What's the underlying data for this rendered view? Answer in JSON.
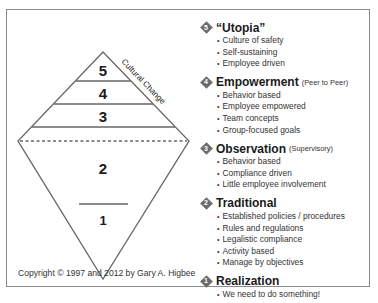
{
  "diagram": {
    "pyramid_labels": [
      "5",
      "4",
      "3",
      "2",
      "1"
    ],
    "axis_label": "Cultural Change",
    "copyright": "Copyright © 1997 and 2012 by Gary A. Higbee",
    "colors": {
      "line": "#666666",
      "badge": "#6b6b6b",
      "frame": "#8a8a8a"
    }
  },
  "levels": [
    {
      "number": "5",
      "title": "“Utopia”",
      "subtitle": "",
      "bullets": [
        "Culture of safety",
        "Self-sustaining",
        "Employee driven"
      ]
    },
    {
      "number": "4",
      "title": "Empowerment",
      "subtitle": "(Peer to Peer)",
      "bullets": [
        "Behavior based",
        "Employee empowered",
        "Team concepts",
        "Group-focused goals"
      ]
    },
    {
      "number": "3",
      "title": "Observation",
      "subtitle": "(Supervisory)",
      "bullets": [
        "Behavior based",
        "Compliance driven",
        "Little employee involvement"
      ]
    },
    {
      "number": "2",
      "title": "Traditional",
      "subtitle": "",
      "bullets": [
        "Established policies / procedures",
        "Rules and regulations",
        "Legalistic compliance",
        "Activity based",
        "Manage by objectives"
      ]
    },
    {
      "number": "1",
      "title": "Realization",
      "subtitle": "",
      "bullets": [
        "We need to do something!"
      ]
    }
  ]
}
